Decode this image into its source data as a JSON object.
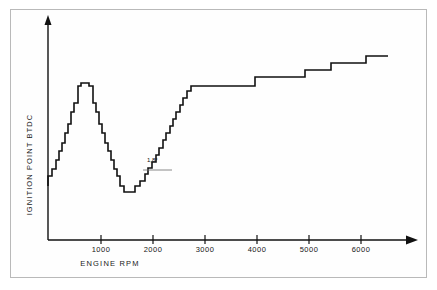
{
  "figure": {
    "background": "#ffffff",
    "frame_color": "#b9b9b9",
    "line_color": "#111111"
  },
  "axes": {
    "x_title": "ENGINE  RPM",
    "y_title": "IGNITION POINT BTDC",
    "x_ticks": [
      {
        "label": "1000",
        "value": 1000,
        "px": 101
      },
      {
        "label": "2000",
        "value": 2000,
        "px": 153
      },
      {
        "label": "3000",
        "value": 3000,
        "px": 205
      },
      {
        "label": "4000",
        "value": 4000,
        "px": 257
      },
      {
        "label": "5000",
        "value": 5000,
        "px": 309
      },
      {
        "label": "6000",
        "value": 6000,
        "px": 361
      }
    ]
  },
  "annotation": {
    "label": "1,8°",
    "x_px": 147,
    "y_px": 157
  },
  "chart_data": {
    "type": "line",
    "subtype": "step",
    "title": "",
    "xlabel": "ENGINE  RPM",
    "ylabel": "IGNITION POINT BTDC",
    "xlim": [
      0,
      7200
    ],
    "ylim": [
      0,
      30
    ],
    "grid": false,
    "legend": "none",
    "series": [
      {
        "name": "Ignition advance map",
        "step_shape": "post",
        "annotations": [
          "1,8° per step"
        ],
        "x": [
          0,
          120,
          250,
          380,
          500,
          620,
          740,
          860,
          980,
          1060,
          1160,
          1280,
          1400,
          1520,
          1640,
          1740,
          1840,
          1940,
          2040,
          2140,
          2260,
          2380,
          2500,
          2620,
          2740,
          2860,
          3060,
          3260,
          3460,
          3660,
          3860,
          4060,
          4160,
          4360,
          4560,
          4760,
          4960,
          5160,
          5300,
          5500,
          5700,
          5860,
          6060,
          6260,
          6460,
          6660,
          6800,
          7000,
          7200
        ],
        "y": [
          5.4,
          5.4,
          7.2,
          9.0,
          10.8,
          12.6,
          14.4,
          16.2,
          18.0,
          18.0,
          18.0,
          16.2,
          14.4,
          12.6,
          10.8,
          9.0,
          7.2,
          5.4,
          3.6,
          3.6,
          3.6,
          3.6,
          3.6,
          3.6,
          3.6,
          5.4,
          5.4,
          5.4,
          7.2,
          9.0,
          10.8,
          12.6,
          14.4,
          16.2,
          18.0,
          19.8,
          21.6,
          23.4,
          23.4,
          23.4,
          23.4,
          23.4,
          25.2,
          25.2,
          27.0,
          27.0,
          28.8,
          28.8,
          28.8
        ],
        "px_points": [
          [
            48,
            186
          ],
          [
            48,
            176
          ],
          [
            52,
            176
          ],
          [
            52,
            169
          ],
          [
            56,
            169
          ],
          [
            56,
            160
          ],
          [
            59,
            160
          ],
          [
            59,
            151
          ],
          [
            62,
            151
          ],
          [
            62,
            143
          ],
          [
            65,
            143
          ],
          [
            65,
            133
          ],
          [
            68,
            133
          ],
          [
            68,
            124
          ],
          [
            71,
            124
          ],
          [
            71,
            112
          ],
          [
            74,
            112
          ],
          [
            74,
            103
          ],
          [
            78,
            103
          ],
          [
            78,
            86
          ],
          [
            81,
            86
          ],
          [
            81,
            83
          ],
          [
            89,
            83
          ],
          [
            89,
            86
          ],
          [
            93,
            86
          ],
          [
            93,
            103
          ],
          [
            96,
            103
          ],
          [
            96,
            112
          ],
          [
            99,
            112
          ],
          [
            99,
            124
          ],
          [
            102,
            124
          ],
          [
            102,
            133
          ],
          [
            105,
            133
          ],
          [
            105,
            143
          ],
          [
            108,
            143
          ],
          [
            108,
            151
          ],
          [
            111,
            151
          ],
          [
            111,
            160
          ],
          [
            114,
            160
          ],
          [
            114,
            169
          ],
          [
            117,
            169
          ],
          [
            117,
            176
          ],
          [
            120,
            176
          ],
          [
            120,
            186
          ],
          [
            124,
            186
          ],
          [
            124,
            192
          ],
          [
            135,
            192
          ],
          [
            135,
            186
          ],
          [
            140,
            186
          ],
          [
            140,
            181
          ],
          [
            145,
            181
          ],
          [
            145,
            174
          ],
          [
            148,
            174
          ],
          [
            148,
            168
          ],
          [
            152,
            168
          ],
          [
            152,
            162
          ],
          [
            156,
            162
          ],
          [
            156,
            155
          ],
          [
            159,
            155
          ],
          [
            159,
            148
          ],
          [
            163,
            148
          ],
          [
            163,
            140
          ],
          [
            166,
            140
          ],
          [
            166,
            133
          ],
          [
            170,
            133
          ],
          [
            170,
            126
          ],
          [
            173,
            126
          ],
          [
            173,
            119
          ],
          [
            176,
            119
          ],
          [
            176,
            112
          ],
          [
            180,
            112
          ],
          [
            180,
            105
          ],
          [
            183,
            105
          ],
          [
            183,
            98
          ],
          [
            187,
            98
          ],
          [
            187,
            91
          ],
          [
            191,
            91
          ],
          [
            191,
            86
          ],
          [
            255,
            86
          ],
          [
            255,
            77
          ],
          [
            305,
            77
          ],
          [
            305,
            70
          ],
          [
            331,
            70
          ],
          [
            331,
            63
          ],
          [
            366,
            63
          ],
          [
            366,
            56
          ],
          [
            388,
            56
          ]
        ]
      }
    ]
  }
}
